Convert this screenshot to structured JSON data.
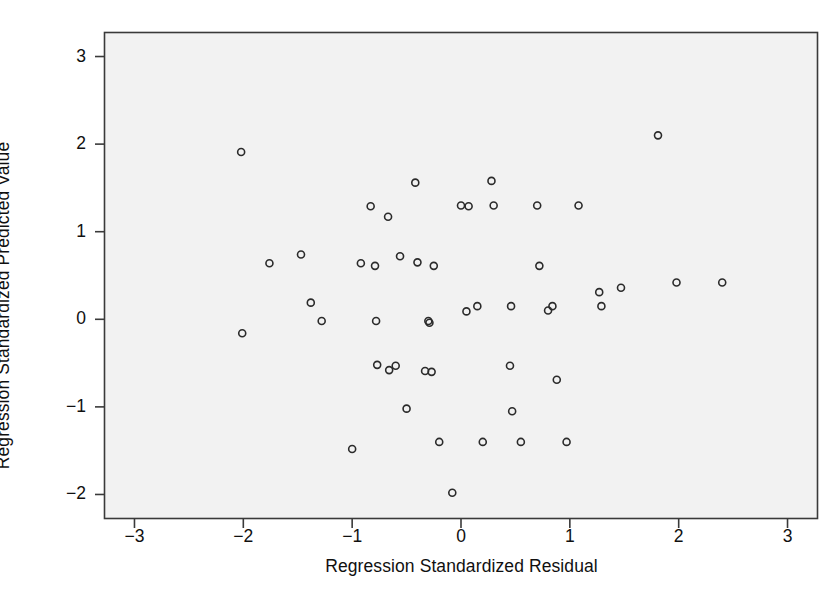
{
  "chart_data": {
    "type": "scatter",
    "title": "",
    "xlabel": "Regression Standardized Residual",
    "ylabel": "Regression Standardized Predicted Value",
    "xlim": [
      -3.28,
      3.28
    ],
    "ylim": [
      -2.28,
      3.28
    ],
    "xticks": [
      -3,
      -2,
      -1,
      0,
      1,
      2,
      3
    ],
    "xtick_labels": [
      "-3",
      "-2",
      "-1",
      "0",
      "1",
      "2",
      "3"
    ],
    "yticks": [
      -2,
      -1,
      0,
      1,
      2,
      3
    ],
    "ytick_labels": [
      "-2",
      "-1",
      "0",
      "1",
      "2",
      "3"
    ],
    "grid": false,
    "legend": null,
    "marker": "open-circle",
    "marker_size": 7,
    "marker_color": "#2b2b2b",
    "plot_background": "#f2f2f2",
    "frame_color": "#3a3a3a",
    "points": [
      [
        -2.02,
        1.91
      ],
      [
        -2.01,
        -0.16
      ],
      [
        -1.76,
        0.64
      ],
      [
        -1.47,
        0.74
      ],
      [
        -1.38,
        0.19
      ],
      [
        -1.28,
        -0.02
      ],
      [
        -1.0,
        -1.48
      ],
      [
        -0.92,
        0.64
      ],
      [
        -0.83,
        1.29
      ],
      [
        -0.79,
        0.61
      ],
      [
        -0.78,
        -0.02
      ],
      [
        -0.77,
        -0.52
      ],
      [
        -0.67,
        1.17
      ],
      [
        -0.66,
        -0.58
      ],
      [
        -0.6,
        -0.53
      ],
      [
        -0.56,
        0.72
      ],
      [
        -0.5,
        -1.02
      ],
      [
        -0.42,
        1.56
      ],
      [
        -0.4,
        0.65
      ],
      [
        -0.33,
        -0.59
      ],
      [
        -0.3,
        -0.02
      ],
      [
        -0.29,
        -0.04
      ],
      [
        -0.27,
        -0.6
      ],
      [
        -0.25,
        0.61
      ],
      [
        -0.2,
        -1.4
      ],
      [
        -0.08,
        -1.98
      ],
      [
        0.0,
        1.3
      ],
      [
        0.05,
        0.09
      ],
      [
        0.07,
        1.29
      ],
      [
        0.15,
        0.15
      ],
      [
        0.2,
        -1.4
      ],
      [
        0.28,
        1.58
      ],
      [
        0.3,
        1.3
      ],
      [
        0.45,
        -0.53
      ],
      [
        0.46,
        0.15
      ],
      [
        0.47,
        -1.05
      ],
      [
        0.55,
        -1.4
      ],
      [
        0.7,
        1.3
      ],
      [
        0.72,
        0.61
      ],
      [
        0.8,
        0.1
      ],
      [
        0.84,
        0.15
      ],
      [
        0.88,
        -0.69
      ],
      [
        0.97,
        -1.4
      ],
      [
        1.08,
        1.3
      ],
      [
        1.27,
        0.31
      ],
      [
        1.29,
        0.15
      ],
      [
        1.47,
        0.36
      ],
      [
        1.81,
        2.1
      ],
      [
        1.98,
        0.42
      ],
      [
        2.4,
        0.42
      ]
    ]
  }
}
